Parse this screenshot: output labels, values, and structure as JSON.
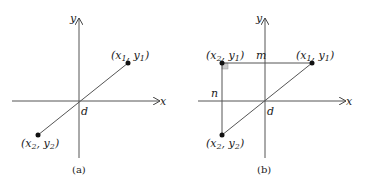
{
  "panels": [
    {
      "caption": "(a)",
      "axis_x_label": "x",
      "axis_y_label": "y",
      "origin_label": "d",
      "point1": {
        "x": "x",
        "xs": "1",
        "y": "y",
        "ys": "1"
      },
      "point2": {
        "x": "x",
        "xs": "2",
        "y": "y",
        "ys": "2"
      }
    },
    {
      "caption": "(b)",
      "axis_x_label": "x",
      "axis_y_label": "y",
      "origin_label": "d",
      "horizontal_intercept_label": "m",
      "vertical_intercept_label": "n",
      "point1": {
        "x": "x",
        "xs": "1",
        "y": "y",
        "ys": "1"
      },
      "point2": {
        "x": "x",
        "xs": "2",
        "y": "y",
        "ys": "2"
      },
      "corner": {
        "x": "x",
        "xs": "2",
        "y": "y",
        "ys": "1"
      }
    }
  ],
  "colors": {
    "line": "#555555",
    "point": "#111111",
    "right_angle_fill": "#cccccc"
  }
}
